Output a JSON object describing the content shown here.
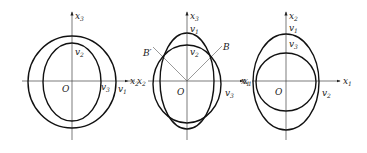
{
  "figure": {
    "panels": [
      {
        "id": "panel-1",
        "vertical_axis": "x3",
        "horizontal_axis": "x2",
        "origin": "O",
        "curves": [
          {
            "label": "v1",
            "shape": "outer-circle"
          },
          {
            "label": "v2",
            "shape": "inner-ellipse-top"
          },
          {
            "label": "v3",
            "shape": "inner-ellipse-right"
          }
        ],
        "labels": {
          "axis_v": "x",
          "axis_v_sub": "3",
          "axis_h": "x",
          "axis_h_sub": "2",
          "origin": "O",
          "c_top": "v",
          "c_top_sub": "2",
          "c_r1": "v",
          "c_r1_sub": "3",
          "c_r2": "v",
          "c_r2_sub": "1"
        }
      },
      {
        "id": "panel-2",
        "vertical_axis": "x3",
        "horizontal_axis": "x1",
        "left_axis_label": "x2",
        "origin": "O",
        "points": [
          "B",
          "B'"
        ],
        "labels": {
          "axis_v": "x",
          "axis_v_sub": "3",
          "axis_h": "x",
          "axis_h_sub": "1",
          "axis_left": "x",
          "axis_left_sub": "2",
          "left_v": "v",
          "left_v_sub": "1",
          "origin": "O",
          "c_top1": "v",
          "c_top1_sub": "1",
          "c_top2": "v",
          "c_top2_sub": "2",
          "c_right": "v",
          "c_right_sub": "3",
          "point_b": "B",
          "point_bp": "B′"
        }
      },
      {
        "id": "panel-3",
        "vertical_axis": "x2",
        "horizontal_axis": "x1",
        "origin": "O",
        "labels": {
          "axis_v": "x",
          "axis_v_sub": "2",
          "axis_h": "x",
          "axis_h_sub": "1",
          "axis_left": "x",
          "axis_left_sub": "1",
          "origin": "O",
          "c_top1": "v",
          "c_top1_sub": "1",
          "c_top2": "v",
          "c_top2_sub": "3",
          "c_right": "v",
          "c_right_sub": "2"
        }
      }
    ]
  }
}
